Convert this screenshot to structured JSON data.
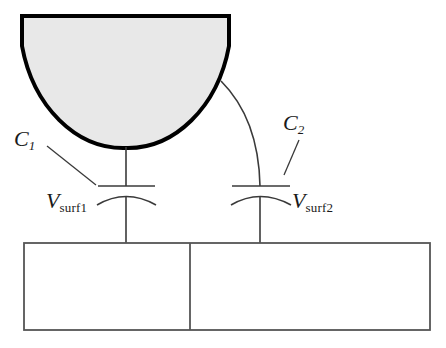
{
  "figure": {
    "type": "schematic-diagram",
    "background_color": "#ffffff",
    "line_color": "#3a3a3a",
    "tip_outline_color": "#000000",
    "tip_fill_color": "#e8e8e8"
  },
  "labels": {
    "c1": {
      "symbol": "C",
      "subscript": "1",
      "subscript_style": "italic"
    },
    "c2": {
      "symbol": "C",
      "subscript": "2",
      "subscript_style": "italic"
    },
    "vsurf1": {
      "symbol": "V",
      "subscript": "surf1",
      "subscript_style": "roman"
    },
    "vsurf2": {
      "symbol": "V",
      "subscript": "surf2",
      "subscript_style": "roman"
    }
  },
  "elements": {
    "tip": {
      "name": "probe-tip",
      "shape": "half-disc",
      "fill": "#e8e8e8",
      "stroke": "#000000",
      "stroke_width": 4
    },
    "capacitor_left": {
      "name": "capacitor-c1",
      "plate_style": "flat-top-curved-bottom"
    },
    "capacitor_right": {
      "name": "capacitor-c2",
      "plate_style": "flat-top-curved-bottom"
    },
    "substrate": {
      "name": "substrate",
      "regions": 2,
      "stroke": "#555555",
      "fill": "#ffffff"
    },
    "wire_left": {
      "name": "wire-tip-to-c1",
      "style": "straight"
    },
    "wire_right": {
      "name": "wire-tip-to-c2",
      "style": "curved"
    },
    "leader_c1": {
      "name": "leader-line-c1"
    },
    "leader_c2": {
      "name": "leader-line-c2"
    }
  }
}
